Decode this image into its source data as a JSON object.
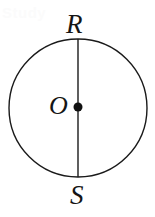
{
  "figure": {
    "type": "geometry-diagram",
    "background_color": "#ffffff",
    "stroke_color": "#1a1a1a",
    "labels": {
      "top_point": "R",
      "center_point": "O",
      "bottom_point": "S"
    },
    "circle": {
      "center_x": 78,
      "center_y": 108,
      "radius": 69,
      "stroke_width": 1.4
    },
    "diameter_segment": {
      "x": 78,
      "y_top": 39,
      "y_bottom": 177,
      "stroke_width": 1.4
    },
    "center_dot": {
      "cx": 78,
      "cy": 107,
      "r": 4.5,
      "fill": "#111111"
    },
    "watermark": {
      "text": "Study",
      "color": "#fbfbfb"
    }
  }
}
